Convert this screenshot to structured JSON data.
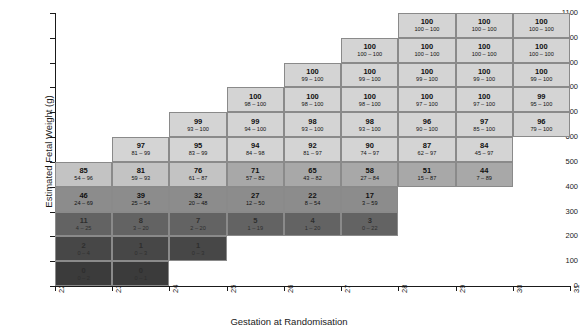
{
  "chart_data": {
    "type": "heatmap",
    "title": "",
    "xlabel": "Gestation at Randomisation",
    "ylabel": "Estimated Fetal Weight (g)",
    "xlim": [
      22,
      31
    ],
    "ylim": [
      0,
      1100
    ],
    "xticks": [
      "22",
      "23",
      "24",
      "25",
      "26",
      "27",
      "28",
      "29",
      "30",
      "31"
    ],
    "yticks": [
      "0",
      "100",
      "200",
      "300",
      "400",
      "500",
      "600",
      "700",
      "800",
      "900",
      "1000",
      "1100"
    ],
    "grid": false,
    "legend": "none",
    "cell_value_label": "probability (%)",
    "cell_ci_label": "95% credible interval",
    "colors": {
      "high": "#d4d4d4",
      "mid_high": "#c3c3c3",
      "mid": "#a8a8a8",
      "mid_low": "#8c8c8c",
      "low": "#636363",
      "lowest": "#474747",
      "darkest": "#3b3b3b",
      "border": "#8a8a8a",
      "axis": "#1a1a1a"
    },
    "cells": [
      {
        "x": 22,
        "y": 0,
        "value": "0",
        "ci": "0 – 2",
        "shade": "darkest"
      },
      {
        "x": 22,
        "y": 100,
        "value": "2",
        "ci": "0 – 4",
        "shade": "lowest"
      },
      {
        "x": 22,
        "y": 200,
        "value": "11",
        "ci": "4 – 25",
        "shade": "low"
      },
      {
        "x": 22,
        "y": 300,
        "value": "46",
        "ci": "24 – 69",
        "shade": "mid_low"
      },
      {
        "x": 22,
        "y": 400,
        "value": "85",
        "ci": "54 – 96",
        "shade": "mid_high"
      },
      {
        "x": 23,
        "y": 0,
        "value": "0",
        "ci": "0 – 1",
        "shade": "darkest"
      },
      {
        "x": 23,
        "y": 100,
        "value": "1",
        "ci": "0 – 3",
        "shade": "lowest"
      },
      {
        "x": 23,
        "y": 200,
        "value": "8",
        "ci": "3 – 20",
        "shade": "low"
      },
      {
        "x": 23,
        "y": 300,
        "value": "39",
        "ci": "25 – 54",
        "shade": "mid_low"
      },
      {
        "x": 23,
        "y": 400,
        "value": "81",
        "ci": "59 – 93",
        "shade": "mid_high"
      },
      {
        "x": 23,
        "y": 500,
        "value": "97",
        "ci": "81 – 99",
        "shade": "high"
      },
      {
        "x": 24,
        "y": 100,
        "value": "1",
        "ci": "0 – 3",
        "shade": "lowest"
      },
      {
        "x": 24,
        "y": 200,
        "value": "7",
        "ci": "2 – 20",
        "shade": "low"
      },
      {
        "x": 24,
        "y": 300,
        "value": "32",
        "ci": "20 – 48",
        "shade": "mid_low"
      },
      {
        "x": 24,
        "y": 400,
        "value": "76",
        "ci": "61 – 87",
        "shade": "mid_high"
      },
      {
        "x": 24,
        "y": 500,
        "value": "95",
        "ci": "83 – 99",
        "shade": "high"
      },
      {
        "x": 24,
        "y": 600,
        "value": "99",
        "ci": "93 – 100",
        "shade": "high"
      },
      {
        "x": 25,
        "y": 200,
        "value": "5",
        "ci": "1 – 19",
        "shade": "low"
      },
      {
        "x": 25,
        "y": 300,
        "value": "27",
        "ci": "12 – 50",
        "shade": "mid_low"
      },
      {
        "x": 25,
        "y": 400,
        "value": "71",
        "ci": "57 – 82",
        "shade": "mid"
      },
      {
        "x": 25,
        "y": 500,
        "value": "94",
        "ci": "84 – 98",
        "shade": "high"
      },
      {
        "x": 25,
        "y": 600,
        "value": "99",
        "ci": "94 – 100",
        "shade": "high"
      },
      {
        "x": 25,
        "y": 700,
        "value": "100",
        "ci": "98 – 100",
        "shade": "high"
      },
      {
        "x": 26,
        "y": 200,
        "value": "4",
        "ci": "1 – 20",
        "shade": "low"
      },
      {
        "x": 26,
        "y": 300,
        "value": "22",
        "ci": "8 – 54",
        "shade": "mid_low"
      },
      {
        "x": 26,
        "y": 400,
        "value": "65",
        "ci": "43 – 82",
        "shade": "mid"
      },
      {
        "x": 26,
        "y": 500,
        "value": "92",
        "ci": "81 – 97",
        "shade": "high"
      },
      {
        "x": 26,
        "y": 600,
        "value": "98",
        "ci": "93 – 100",
        "shade": "high"
      },
      {
        "x": 26,
        "y": 700,
        "value": "100",
        "ci": "98 – 100",
        "shade": "high"
      },
      {
        "x": 26,
        "y": 800,
        "value": "100",
        "ci": "99 – 100",
        "shade": "high"
      },
      {
        "x": 27,
        "y": 200,
        "value": "3",
        "ci": "0 – 22",
        "shade": "low"
      },
      {
        "x": 27,
        "y": 300,
        "value": "17",
        "ci": "3 – 59",
        "shade": "mid_low"
      },
      {
        "x": 27,
        "y": 400,
        "value": "58",
        "ci": "27 – 84",
        "shade": "mid"
      },
      {
        "x": 27,
        "y": 500,
        "value": "90",
        "ci": "74 – 97",
        "shade": "high"
      },
      {
        "x": 27,
        "y": 600,
        "value": "98",
        "ci": "93 – 100",
        "shade": "high"
      },
      {
        "x": 27,
        "y": 700,
        "value": "100",
        "ci": "98 – 100",
        "shade": "high"
      },
      {
        "x": 27,
        "y": 800,
        "value": "100",
        "ci": "99 – 100",
        "shade": "high"
      },
      {
        "x": 27,
        "y": 900,
        "value": "100",
        "ci": "100 – 100",
        "shade": "high"
      },
      {
        "x": 28,
        "y": 400,
        "value": "51",
        "ci": "15 – 87",
        "shade": "mid"
      },
      {
        "x": 28,
        "y": 500,
        "value": "87",
        "ci": "62 – 97",
        "shade": "high"
      },
      {
        "x": 28,
        "y": 600,
        "value": "96",
        "ci": "90 – 100",
        "shade": "high"
      },
      {
        "x": 28,
        "y": 700,
        "value": "100",
        "ci": "97 – 100",
        "shade": "high"
      },
      {
        "x": 28,
        "y": 800,
        "value": "100",
        "ci": "99 – 100",
        "shade": "high"
      },
      {
        "x": 28,
        "y": 900,
        "value": "100",
        "ci": "100 – 100",
        "shade": "high"
      },
      {
        "x": 28,
        "y": 1000,
        "value": "100",
        "ci": "100 – 100",
        "shade": "high"
      },
      {
        "x": 29,
        "y": 400,
        "value": "44",
        "ci": "7 – 89",
        "shade": "mid"
      },
      {
        "x": 29,
        "y": 500,
        "value": "84",
        "ci": "45 – 97",
        "shade": "high"
      },
      {
        "x": 29,
        "y": 600,
        "value": "97",
        "ci": "85 – 100",
        "shade": "high"
      },
      {
        "x": 29,
        "y": 700,
        "value": "100",
        "ci": "97 – 100",
        "shade": "high"
      },
      {
        "x": 29,
        "y": 800,
        "value": "100",
        "ci": "99 – 100",
        "shade": "high"
      },
      {
        "x": 29,
        "y": 900,
        "value": "100",
        "ci": "100 – 100",
        "shade": "high"
      },
      {
        "x": 29,
        "y": 1000,
        "value": "100",
        "ci": "100 – 100",
        "shade": "high"
      },
      {
        "x": 30,
        "y": 600,
        "value": "96",
        "ci": "79 – 100",
        "shade": "high"
      },
      {
        "x": 30,
        "y": 700,
        "value": "99",
        "ci": "95 – 100",
        "shade": "high"
      },
      {
        "x": 30,
        "y": 800,
        "value": "100",
        "ci": "99 – 100",
        "shade": "high"
      },
      {
        "x": 30,
        "y": 900,
        "value": "100",
        "ci": "100 – 100",
        "shade": "high"
      },
      {
        "x": 30,
        "y": 1000,
        "value": "100",
        "ci": "100 – 100",
        "shade": "high"
      }
    ]
  }
}
